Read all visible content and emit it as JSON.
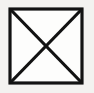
{
  "figure": {
    "symbol_name": "square-with-diagonals",
    "background_color": "#f3f2f0",
    "paper_color": "#fdfdfc",
    "ink_color": "#121212",
    "canvas": {
      "width": 94,
      "height": 93
    },
    "square": {
      "left": 10,
      "top": 9,
      "right": 82,
      "bottom": 83,
      "stroke_width": 3.2
    },
    "diagonals": [
      {
        "name": "diagonal-top-left-to-bottom-right",
        "x1": 10,
        "y1": 9,
        "x2": 82,
        "y2": 83,
        "stroke_width": 3.2
      },
      {
        "name": "diagonal-top-right-to-bottom-left",
        "x1": 82,
        "y1": 9,
        "x2": 10,
        "y2": 83,
        "stroke_width": 3.2
      }
    ],
    "center_point": {
      "x": 46,
      "y": 46
    }
  }
}
